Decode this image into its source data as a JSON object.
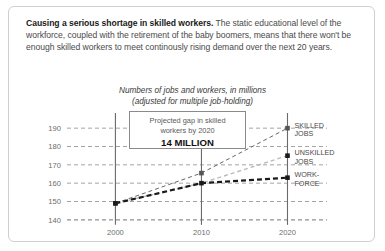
{
  "card": {
    "intro_lead": "Causing a serious shortage in skilled workers.",
    "intro_body": " The static educational level of the workforce, coupled with the retirement of the baby boomers, means that there won't be enough skilled workers to meet continously rising demand over the next 20 years."
  },
  "annotation": {
    "line1": "Projected gap in skilled",
    "line2": "workers by 2020",
    "value": "14 MILLION"
  },
  "chart_data": {
    "type": "line",
    "title": "",
    "subtitle_line1": "Numbers of jobs and workers, in millions",
    "subtitle_line2": "(adjusted for multiple job-holding)",
    "xlabel": "",
    "ylabel": "",
    "x": [
      2000,
      2010,
      2020
    ],
    "xticks": [
      "2000",
      "2010",
      "2020"
    ],
    "yticks": [
      "190",
      "180",
      "170",
      "160",
      "150",
      "140"
    ],
    "ylim": [
      135,
      195
    ],
    "xlim": [
      1996,
      2022.5
    ],
    "grid": true,
    "legend_position": "right-inline",
    "series": [
      {
        "name": "SKILLED JOBS",
        "label_line1": "SKILLED",
        "label_line2": "JOBS",
        "values": [
          149,
          165.5,
          190
        ],
        "color": "#555555",
        "style": "dashed-thin"
      },
      {
        "name": "UNSKILLED JOBS",
        "label_line1": "UNSKILLED",
        "label_line2": "JOBS",
        "values": [
          149,
          160,
          175
        ],
        "color": "#bbbbbb",
        "style": "dashed-light"
      },
      {
        "name": "WORKFORCE",
        "label_line1": "WORK-",
        "label_line2": "FORCE",
        "values": [
          149,
          160,
          163
        ],
        "color": "#1a1a1a",
        "style": "dashed-thick"
      }
    ]
  }
}
